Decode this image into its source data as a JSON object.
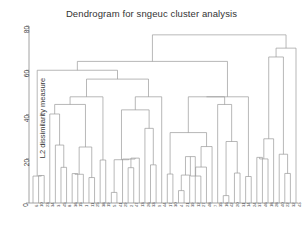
{
  "chart_data": {
    "type": "dendrogram",
    "title": "Dendrogram for sngeuc cluster analysis",
    "xlabel": "",
    "ylabel": "L2 dissimilarity measure",
    "ylim": [
      0,
      80
    ],
    "yticks": [
      0,
      20,
      40,
      60,
      80
    ],
    "grid": false,
    "legend": null,
    "orientation": "vertical",
    "n_leaves": 48,
    "leaf_labels": [
      "6",
      "10",
      "23",
      "34",
      "3",
      "45",
      "8",
      "36",
      "15",
      "1",
      "11",
      "25",
      "38",
      "19",
      "5",
      "41",
      "29",
      "2",
      "47",
      "13",
      "26",
      "33",
      "9",
      "44",
      "17",
      "30",
      "4",
      "21",
      "39",
      "12",
      "27",
      "48",
      "7",
      "35",
      "16",
      "42",
      "20",
      "31",
      "14",
      "24",
      "37",
      "46",
      "18",
      "28",
      "40",
      "22",
      "32",
      "43"
    ],
    "root_height": 76,
    "axis_note": "heights are L2 dissimilarity values",
    "merges": [
      {
        "height": 76,
        "note": "root join of leftmost singleton to rest"
      },
      {
        "height": 70,
        "note": "second level split"
      },
      {
        "height": 66,
        "note": "third level split"
      },
      {
        "height": 64,
        "note": "large right-hand cluster joins"
      },
      {
        "height": 60,
        "note": "far-right tight cluster root"
      },
      {
        "height": 56,
        "note": "central cluster join"
      },
      {
        "height": 47,
        "note": "mid-level merge"
      },
      {
        "height": 44,
        "note": "mid-level merge"
      },
      {
        "height": 41,
        "note": "mid-level merge"
      },
      {
        "height": 38,
        "note": "mid-level merge"
      },
      {
        "height": 34,
        "note": "sub-cluster merge"
      },
      {
        "height": 31,
        "note": "sub-cluster merge"
      },
      {
        "height": 28,
        "note": "sub-cluster merge"
      },
      {
        "height": 25,
        "note": "sub-cluster merge"
      },
      {
        "height": 22,
        "note": "low merge"
      },
      {
        "height": 18,
        "note": "low merge"
      },
      {
        "height": 14,
        "note": "low merge"
      },
      {
        "height": 10,
        "note": "low merge"
      },
      {
        "height": 7,
        "note": "leaf-pair merge"
      },
      {
        "height": 4,
        "note": "leaf-pair merge"
      }
    ]
  }
}
